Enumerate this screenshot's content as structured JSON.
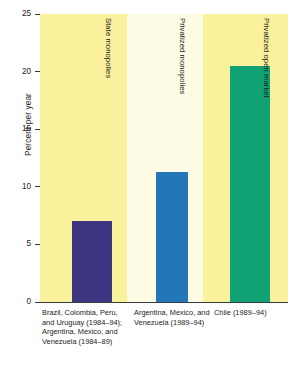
{
  "chart_data": {
    "type": "bar",
    "title": "",
    "subtitle": "",
    "xlabel": "",
    "ylabel": "Percent per year",
    "ylim": [
      0,
      25
    ],
    "yticks": [
      0,
      5,
      10,
      15,
      20,
      25
    ],
    "ytick_labels": [
      "0",
      "5",
      "10",
      "15",
      "20",
      "25"
    ],
    "grid": false,
    "legend": "none",
    "categories": [
      "Brazil, Colombia, Peru, and Uruguay (1984–94); Argentina, Mexico, and Venezuela (1984–89)",
      "Argentina, Mexico, and Venezuela (1989–94)",
      "Chile (1989–94)"
    ],
    "values": [
      7.0,
      11.3,
      20.5
    ],
    "bar_colors": [
      "#3c3582",
      "#2377b9",
      "#10a274"
    ],
    "group_labels": [
      "State monopolies",
      "Privatized monopolies",
      "Privatized open market"
    ],
    "annotations": []
  },
  "axis": {
    "y_title": "Percent per year",
    "ticks": [
      {
        "label": "25",
        "value": 25
      },
      {
        "label": "20",
        "value": 20
      },
      {
        "label": "15",
        "value": 15
      },
      {
        "label": "10",
        "value": 10
      },
      {
        "label": "5",
        "value": 5
      },
      {
        "label": "0",
        "value": 0
      }
    ]
  },
  "columns": [
    {
      "group_label": "State monopolies",
      "bar_value": 7.0,
      "bar_color": "#3c3582",
      "caption": "Brazil, Colombia, Peru, and Uruguay (1984–94); Argentina, Mexico, and Venezuela (1984–89)"
    },
    {
      "group_label": "Privatized monopolies",
      "bar_value": 11.3,
      "bar_color": "#2377b9",
      "caption": "Argentina, Mexico, and Venezuela (1989–94)"
    },
    {
      "group_label": "Privatized open market",
      "bar_value": 20.5,
      "bar_color": "#10a274",
      "caption": "Chile (1989–94)"
    }
  ],
  "style": {
    "band_color_primary": "#faf19c",
    "band_color_secondary": "#fdfbe3",
    "axis_color": "#3a3a3a",
    "text_color": "#1b1b1b",
    "page_background": "#ffffff"
  }
}
